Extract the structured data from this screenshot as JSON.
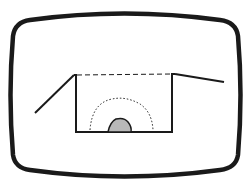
{
  "diagram": {
    "colors": {
      "stroke": "#1a1a1a",
      "fill_mound": "#b8b8b8",
      "background": "#ffffff"
    },
    "elements": [
      {
        "name": "screen-frame",
        "type": "rounded-rectangle"
      },
      {
        "name": "left-slope",
        "type": "line"
      },
      {
        "name": "pit-outline",
        "type": "polyline"
      },
      {
        "name": "pit-top-dashed",
        "type": "dashed-line"
      },
      {
        "name": "right-slope",
        "type": "line"
      },
      {
        "name": "dotted-zone",
        "type": "dotted-arc"
      },
      {
        "name": "mound",
        "type": "filled-shape"
      }
    ]
  }
}
